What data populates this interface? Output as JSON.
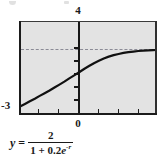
{
  "figure": {
    "name": "logistic-growth-graph",
    "panel_fill": "#e3e3e3",
    "frame_color": "#1b1b1b",
    "curve_color": "#111111",
    "asymptote_color": "#8b8b96"
  },
  "labels": {
    "y_max": "4",
    "y_min": "-3",
    "x_origin": "0"
  },
  "equation": {
    "lhs": "y",
    "equals": "=",
    "numerator": "2",
    "denominator_prefix": "1 + 0.2",
    "denominator_base": "e",
    "denominator_exponent": "-r",
    "plain": "y = 2 / (1 + 0.2e^(-r))"
  },
  "chart_data": {
    "type": "line",
    "title": "",
    "xlabel": "",
    "ylabel": "",
    "xlim": [
      -3,
      4
    ],
    "ylim": [
      -3,
      4
    ],
    "grid": false,
    "legend": null,
    "x_ticks": [
      -3,
      -2,
      -1,
      0,
      1,
      2,
      3,
      4
    ],
    "y_ticks": [
      -3,
      -2,
      -1,
      0,
      1,
      2,
      3,
      4
    ],
    "x_tick_labels": [
      "",
      "",
      "",
      "0",
      "",
      "",
      "",
      ""
    ],
    "y_tick_labels": [
      "-3",
      "",
      "",
      "",
      "",
      "",
      "",
      "4"
    ],
    "annotations": [
      {
        "text": "4",
        "position": "above-y-axis",
        "value": 4
      },
      {
        "text": "-3",
        "position": "lower-left",
        "value": -3
      },
      {
        "text": "0",
        "position": "below-y-axis",
        "value": 0
      }
    ],
    "series": [
      {
        "name": "y = 2/(1 + 0.2e^(-r))",
        "style": "solid",
        "color": "#111111",
        "width": 2.2,
        "x": [
          -3,
          -2.75,
          -2.5,
          -2.25,
          -2,
          -1.75,
          -1.5,
          -1.25,
          -1,
          -0.75,
          -0.5,
          -0.25,
          0,
          0.25,
          0.5,
          0.75,
          1,
          1.25,
          1.5,
          1.75,
          2,
          2.25,
          2.5,
          2.75,
          3,
          3.25,
          3.5,
          3.75,
          4
        ],
        "y": [
          -2.3,
          -2.1,
          -1.9,
          -1.71,
          -1.5,
          -1.3,
          -1.1,
          -0.88,
          -0.66,
          -0.44,
          -0.2,
          0.03,
          0.26,
          0.5,
          0.72,
          0.93,
          1.11,
          1.28,
          1.42,
          1.53,
          1.62,
          1.7,
          1.76,
          1.8,
          1.84,
          1.87,
          1.89,
          1.91,
          1.92
        ]
      },
      {
        "name": "horizontal asymptote y = 2",
        "style": "dashed",
        "color": "#8b8b96",
        "width": 1,
        "x": [
          -3,
          4
        ],
        "y": [
          2,
          2
        ]
      }
    ]
  }
}
